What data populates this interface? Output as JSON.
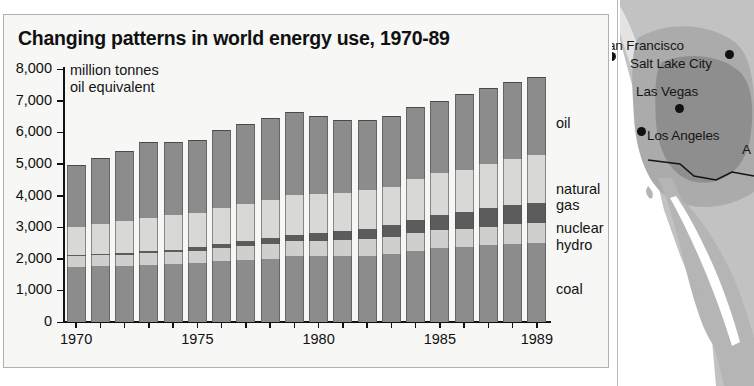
{
  "chart": {
    "title": "Changing patterns in world energy use, 1970-89",
    "unit_line1": "million tonnes",
    "unit_line2": "oil equivalent",
    "y_tick_labels": [
      "8,000",
      "7,000",
      "6,000",
      "5,000",
      "4,000",
      "3,000",
      "2,000",
      "1,000",
      "0"
    ],
    "x_tick_labels": [
      "1970",
      "1975",
      "1980",
      "1985",
      "1989"
    ],
    "legend": [
      {
        "key": "oil",
        "label": "oil"
      },
      {
        "key": "natural_gas",
        "label": "natural\ngas"
      },
      {
        "key": "nuclear",
        "label": "nuclear"
      },
      {
        "key": "hydro",
        "label": "hydro"
      },
      {
        "key": "coal",
        "label": "coal"
      }
    ],
    "legend_labels": {
      "oil": "oil",
      "natural_gas_1": "natural",
      "natural_gas_2": "gas",
      "nuclear": "nuclear",
      "hydro": "hydro",
      "coal": "coal"
    },
    "colors": {
      "oil": "#8c8c8c",
      "natural_gas": "#d8d8d6",
      "nuclear": "#5c5c5c",
      "hydro": "#cfcfcd",
      "coal": "#8c8c8c",
      "panel_background": "#f7f7f5",
      "axis": "#121212",
      "text": "#101010"
    }
  },
  "chart_data": {
    "type": "bar",
    "subtype": "stacked",
    "title": "Changing patterns in world energy use, 1970-89",
    "xlabel": "",
    "ylabel": "million tonnes oil equivalent",
    "ylim": [
      0,
      8000
    ],
    "ytick_step": 1000,
    "grid": false,
    "legend_position": "right",
    "categories": [
      "1970",
      "1971",
      "1972",
      "1973",
      "1974",
      "1975",
      "1976",
      "1977",
      "1978",
      "1979",
      "1980",
      "1981",
      "1982",
      "1983",
      "1984",
      "1985",
      "1986",
      "1987",
      "1988",
      "1989"
    ],
    "series": [
      {
        "name": "coal",
        "values": [
          1750,
          1760,
          1770,
          1800,
          1820,
          1860,
          1920,
          1960,
          2000,
          2080,
          2080,
          2080,
          2100,
          2150,
          2250,
          2330,
          2360,
          2420,
          2470,
          2500
        ]
      },
      {
        "name": "hydro",
        "values": [
          330,
          345,
          360,
          370,
          385,
          400,
          420,
          435,
          455,
          470,
          480,
          500,
          520,
          545,
          560,
          575,
          590,
          600,
          615,
          625
        ]
      },
      {
        "name": "nuclear",
        "values": [
          30,
          40,
          55,
          70,
          85,
          110,
          135,
          165,
          195,
          215,
          245,
          285,
          320,
          360,
          430,
          490,
          530,
          570,
          610,
          640
        ]
      },
      {
        "name": "natural_gas",
        "values": [
          890,
          955,
          1010,
          1060,
          1080,
          1090,
          1140,
          1160,
          1200,
          1240,
          1250,
          1230,
          1230,
          1230,
          1290,
          1310,
          1330,
          1400,
          1460,
          1510
        ]
      },
      {
        "name": "oil",
        "values": [
          1950,
          2100,
          2205,
          2400,
          2330,
          2290,
          2455,
          2530,
          2600,
          2645,
          2445,
          2305,
          2230,
          2215,
          2270,
          2295,
          2390,
          2410,
          2445,
          2475
        ]
      }
    ],
    "totals": [
      4950,
      5200,
      5400,
      5700,
      5700,
      5750,
      6070,
      6250,
      6450,
      6650,
      6500,
      6400,
      6400,
      6500,
      6800,
      7000,
      7200,
      7400,
      7600,
      7750
    ],
    "stack_order_bottom_to_top": [
      "coal",
      "hydro",
      "nuclear",
      "natural_gas",
      "oil"
    ]
  },
  "map": {
    "labels": [
      {
        "name": "san-francisco",
        "text": "San Francisco"
      },
      {
        "name": "salt-lake-city",
        "text": "Salt Lake City"
      },
      {
        "name": "las-vegas",
        "text": "Las Vegas"
      },
      {
        "name": "los-angeles",
        "text": "Los Angeles"
      },
      {
        "name": "partial-right",
        "text": "A"
      }
    ],
    "colors": {
      "land": "#b9b9b9",
      "zone_mid": "#a8a8a8",
      "zone_dark": "#8f8f8f",
      "ocean": "#ffffff",
      "border": "#1a1a1a"
    }
  }
}
